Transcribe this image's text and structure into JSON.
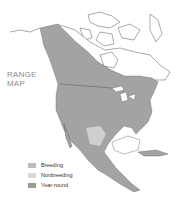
{
  "title": {
    "line1": "RANGE",
    "line2": "MAP"
  },
  "legend": [
    {
      "label": "Breeding",
      "color": "#bdbdbd"
    },
    {
      "label": "Nonbreeding",
      "color": "#d9d9d9"
    },
    {
      "label": "Year-round",
      "color": "#9a9a9a"
    }
  ],
  "colors": {
    "range": "#a0a0a0",
    "breeding": "#bdbdbd",
    "nonbreeding": "#d6d6d6",
    "outline": "#444444"
  }
}
